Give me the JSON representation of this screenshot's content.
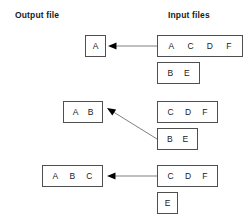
{
  "headers": {
    "output": "Output file",
    "input": "Input files"
  },
  "colors": {
    "background": "#ffffff",
    "box_border": "#4f4f4f",
    "text": "#1a1a1a",
    "arrow_line": "#808080",
    "arrow_head": "#000000"
  },
  "rows": [
    {
      "output": {
        "cells": [
          "A"
        ],
        "x": 85,
        "y": 35,
        "w": 21,
        "h": 22
      },
      "inputs": [
        {
          "cells": [
            "A",
            "C",
            "D",
            "F"
          ],
          "x": 157,
          "y": 35,
          "w": 86,
          "h": 22
        },
        {
          "cells": [
            "B",
            "E"
          ],
          "x": 157,
          "y": 62,
          "w": 43,
          "h": 22
        }
      ],
      "arrow": {
        "x1": 157,
        "y1": 46,
        "x2": 108,
        "y2": 46
      }
    },
    {
      "output": {
        "cells": [
          "A",
          "B"
        ],
        "x": 63,
        "y": 101,
        "w": 40,
        "h": 22
      },
      "inputs": [
        {
          "cells": [
            "C",
            "D",
            "F"
          ],
          "x": 157,
          "y": 101,
          "w": 61,
          "h": 22
        },
        {
          "cells": [
            "B",
            "E"
          ],
          "x": 157,
          "y": 128,
          "w": 41,
          "h": 22
        }
      ],
      "arrow": {
        "x1": 157,
        "y1": 139,
        "x2": 107,
        "y2": 108
      }
    },
    {
      "output": {
        "cells": [
          "A",
          "B",
          "C"
        ],
        "x": 42,
        "y": 165,
        "w": 61,
        "h": 22
      },
      "inputs": [
        {
          "cells": [
            "C",
            "D",
            "F"
          ],
          "x": 157,
          "y": 165,
          "w": 61,
          "h": 22
        },
        {
          "cells": [
            "E"
          ],
          "x": 157,
          "y": 192,
          "w": 21,
          "h": 22
        }
      ],
      "arrow": {
        "x1": 157,
        "y1": 176,
        "x2": 107,
        "y2": 176
      }
    }
  ]
}
